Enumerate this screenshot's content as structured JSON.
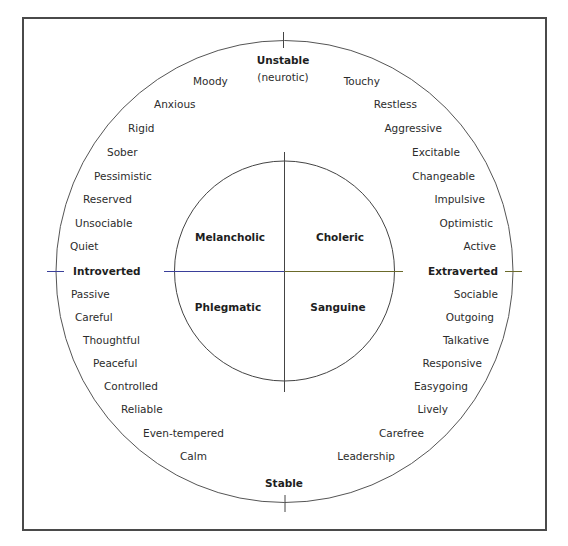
{
  "diagram": {
    "title_axes": {
      "top": "Unstable",
      "top_sub": "(neurotic)",
      "bottom": "Stable",
      "left": "Introverted",
      "right": "Extraverted"
    },
    "quadrants": {
      "top_left": "Melancholic",
      "top_right": "Choleric",
      "bottom_left": "Phlegmatic",
      "bottom_right": "Sanguine"
    },
    "traits": {
      "upper_left": [
        "Moody",
        "Anxious",
        "Rigid",
        "Sober",
        "Pessimistic",
        "Reserved",
        "Unsociable",
        "Quiet"
      ],
      "lower_left": [
        "Passive",
        "Careful",
        "Thoughtful",
        "Peaceful",
        "Controlled",
        "Reliable",
        "Even-tempered",
        "Calm"
      ],
      "upper_right": [
        "Touchy",
        "Restless",
        "Aggressive",
        "Excitable",
        "Changeable",
        "Impulsive",
        "Optimistic",
        "Active"
      ],
      "lower_right": [
        "Sociable",
        "Outgoing",
        "Talkative",
        "Responsive",
        "Easygoing",
        "Lively",
        "Carefree",
        "Leadership"
      ]
    },
    "colors": {
      "frame": "#4a4a4a",
      "circle": "#555555",
      "left_axis": "#3a3f9a",
      "right_axis": "#6b6a2a",
      "vertical_axis": "#444444"
    }
  }
}
